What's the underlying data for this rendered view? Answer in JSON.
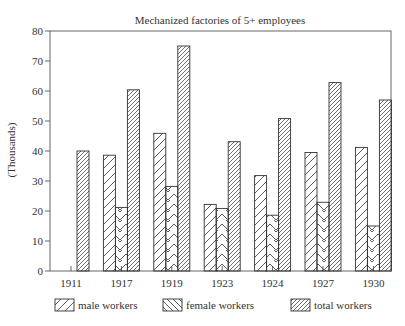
{
  "chart_data": {
    "type": "bar",
    "title": "Mechanized factories of 5+ employees",
    "xlabel": "",
    "ylabel": "(Thousands)",
    "ylim": [
      0,
      80
    ],
    "yticks": [
      0,
      10,
      20,
      30,
      40,
      50,
      60,
      70,
      80
    ],
    "grid": false,
    "legend_position": "bottom",
    "categories": [
      "1911",
      "1917",
      "1919",
      "1923",
      "1924",
      "1927",
      "1930"
    ],
    "series": [
      {
        "name": "male workers",
        "pattern": "wide-diagonal-forward",
        "values": [
          null,
          38.6,
          45.9,
          22.2,
          31.8,
          39.5,
          41.2
        ]
      },
      {
        "name": "female workers",
        "pattern": "chevron-backward",
        "values": [
          null,
          21.2,
          28.2,
          20.8,
          18.6,
          22.9,
          15.0
        ]
      },
      {
        "name": "total workers",
        "pattern": "dense-diagonal-forward",
        "values": [
          40.0,
          60.4,
          75.0,
          43.1,
          50.8,
          62.8,
          57.0
        ]
      }
    ]
  },
  "colors": {
    "ink": "#333333",
    "background": "#ffffff"
  }
}
